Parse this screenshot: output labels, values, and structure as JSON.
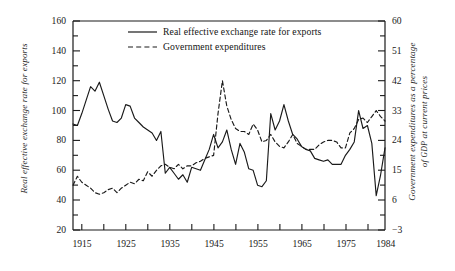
{
  "chart_data": {
    "type": "line",
    "title": "",
    "xlabel": "",
    "xlim": [
      1913,
      1984
    ],
    "grid": false,
    "legend_position": "top-center",
    "xticks_major": [
      1915,
      1925,
      1935,
      1945,
      1955,
      1965,
      1975,
      1984
    ],
    "xticks_minor": [
      1920,
      1930,
      1940,
      1950,
      1960,
      1970,
      1980
    ],
    "axes": [
      {
        "side": "left",
        "label": "Real effective exchange rate for exports",
        "ylim": [
          20,
          160
        ],
        "ticks": [
          20,
          40,
          60,
          80,
          100,
          120,
          140,
          160
        ],
        "minor_ticks": [
          30,
          50,
          70,
          90,
          110,
          130,
          150
        ]
      },
      {
        "side": "right",
        "label_line1": "Government expenditures as a percentage",
        "label_line2_pre": "of ",
        "label_line2_caps": "GDP",
        "label_line2_post": " at current prices",
        "ylim": [
          -3,
          60
        ],
        "ticks": [
          -3,
          6,
          15,
          24,
          33,
          42,
          51,
          60
        ],
        "minor_ticks": [
          1.5,
          10.5,
          19.5,
          28.5,
          37.5,
          46.5,
          55.5
        ]
      }
    ],
    "series": [
      {
        "name": "Real effective exchange rate for exports",
        "axis": "left",
        "style": "solid",
        "color": "#1a1a1a",
        "x": [
          1913,
          1914,
          1915,
          1916,
          1917,
          1918,
          1919,
          1920,
          1921,
          1922,
          1923,
          1924,
          1925,
          1926,
          1927,
          1928,
          1929,
          1930,
          1931,
          1932,
          1933,
          1934,
          1935,
          1936,
          1937,
          1938,
          1939,
          1940,
          1941,
          1942,
          1943,
          1944,
          1945,
          1946,
          1947,
          1948,
          1949,
          1950,
          1951,
          1952,
          1953,
          1954,
          1955,
          1956,
          1957,
          1958,
          1959,
          1960,
          1961,
          1962,
          1963,
          1964,
          1965,
          1966,
          1967,
          1968,
          1969,
          1970,
          1971,
          1972,
          1973,
          1974,
          1975,
          1976,
          1977,
          1978,
          1979,
          1980,
          1981,
          1982,
          1983,
          1984
        ],
        "y": [
          91,
          90,
          98,
          107,
          116,
          113,
          119,
          110,
          101,
          93,
          92,
          95,
          104,
          103,
          95,
          92,
          89,
          87,
          85,
          80,
          86,
          58,
          62,
          58,
          54,
          57,
          52,
          62,
          61,
          60,
          67,
          74,
          84,
          75,
          79,
          87,
          74,
          64,
          78,
          72,
          61,
          60,
          50,
          49,
          53,
          98,
          87,
          93,
          104,
          93,
          84,
          81,
          76,
          74,
          73,
          68,
          67,
          66,
          67,
          64,
          64,
          64,
          70,
          74,
          79,
          100,
          88,
          90,
          78,
          43,
          57,
          75
        ],
        "y_end_1984": 70
      },
      {
        "name": "Government expenditures",
        "axis": "right",
        "style": "dashed",
        "color": "#1a1a1a",
        "x": [
          1913,
          1914,
          1915,
          1916,
          1917,
          1918,
          1919,
          1920,
          1921,
          1922,
          1923,
          1924,
          1925,
          1926,
          1927,
          1928,
          1929,
          1930,
          1931,
          1932,
          1933,
          1934,
          1935,
          1936,
          1937,
          1938,
          1939,
          1940,
          1941,
          1942,
          1943,
          1944,
          1945,
          1946,
          1947,
          1948,
          1949,
          1950,
          1951,
          1952,
          1953,
          1954,
          1955,
          1956,
          1957,
          1958,
          1959,
          1960,
          1961,
          1962,
          1963,
          1964,
          1965,
          1966,
          1967,
          1968,
          1969,
          1970,
          1971,
          1972,
          1973,
          1974,
          1975,
          1976,
          1977,
          1978,
          1979,
          1980,
          1981,
          1982,
          1983,
          1984
        ],
        "y_left_equiv": [
          50,
          56,
          52,
          50,
          48,
          45,
          44,
          45,
          47,
          48,
          45,
          48,
          50,
          52,
          51,
          54,
          53,
          59,
          56,
          60,
          63,
          64,
          62,
          61,
          64,
          61,
          63,
          63,
          65,
          66,
          68,
          69,
          70,
          98,
          120,
          103,
          94,
          88,
          86,
          86,
          84,
          91,
          87,
          79,
          80,
          84,
          79,
          76,
          75,
          79,
          84,
          78,
          76,
          74,
          74,
          74,
          77,
          79,
          80,
          80,
          79,
          75,
          75,
          85,
          88,
          94,
          95,
          92,
          96,
          100,
          96,
          93
        ],
        "peak_year": 1947,
        "peak_value_right_axis": 42
      }
    ]
  },
  "legend": {
    "items": [
      {
        "label": "Real effective exchange rate for exports",
        "style": "solid"
      },
      {
        "label": "Government expenditures",
        "style": "dashed"
      }
    ]
  },
  "axis_labels": {
    "left_title": "Real effective exchange rate for exports",
    "right_title_line1": "Government expenditures as a percentage",
    "right_title_line2_pre": "of ",
    "right_title_line2_caps": "GDP",
    "right_title_line2_post": " at current prices",
    "left_ticks": [
      "160",
      "140",
      "120",
      "100",
      "80",
      "60",
      "40",
      "20"
    ],
    "right_ticks": [
      "60",
      "51",
      "42",
      "33",
      "24",
      "15",
      "6",
      "−3"
    ],
    "x_ticks": [
      "1915",
      "1925",
      "1935",
      "1945",
      "1955",
      "1965",
      "1975",
      "1984"
    ]
  }
}
